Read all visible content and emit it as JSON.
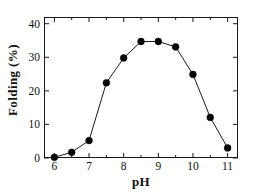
{
  "chart_data": {
    "type": "line",
    "title": "",
    "xlabel": "pH",
    "ylabel": "Folding (%)",
    "x": [
      6,
      6.5,
      7,
      7.5,
      8,
      8.5,
      9,
      9.5,
      10,
      10.5,
      11
    ],
    "values": [
      0.2,
      1.7,
      5.2,
      22.4,
      29.8,
      34.7,
      34.7,
      33.1,
      24.9,
      12.1,
      3.0
    ],
    "series": [
      {
        "name": "Folding",
        "values": [
          0.2,
          1.7,
          5.2,
          22.4,
          29.8,
          34.7,
          34.7,
          33.1,
          24.9,
          12.1,
          3.0
        ]
      }
    ],
    "xlim": [
      5.7,
      11.3
    ],
    "ylim": [
      0,
      42
    ],
    "xticks": [
      6,
      7,
      8,
      9,
      10,
      11
    ],
    "xminorticks": [
      6.5,
      7.5,
      8.5,
      9.5,
      10.5
    ],
    "yticks": [
      0,
      10,
      20,
      30,
      40
    ],
    "xticklabels": [
      "6",
      "7",
      "8",
      "9",
      "10",
      "11"
    ],
    "yticklabels": [
      "0",
      "10",
      "20",
      "30",
      "40"
    ],
    "grid": false,
    "legend": false,
    "legend_position": "none",
    "marker": "filled-circle",
    "marker_color": "#000000",
    "line_color": "#1a1a1a",
    "axis_color": "#1a1a1a",
    "background_color": "#ffffff"
  }
}
